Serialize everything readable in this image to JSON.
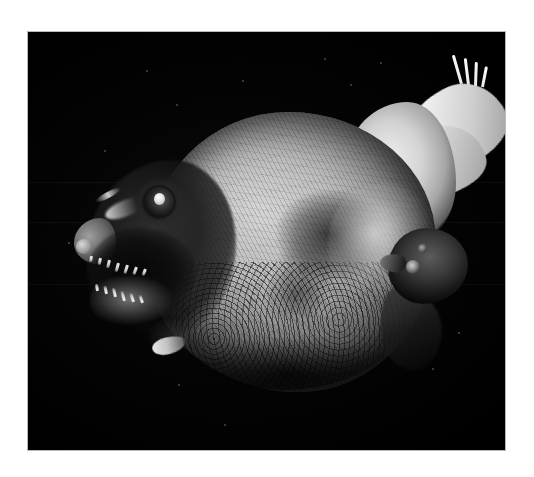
{
  "page": {
    "background_color": "#ffffff",
    "width": 534,
    "height": 477
  },
  "photo": {
    "alt": "Black-and-white photograph of a preserved deep-sea fish specimen on a black background",
    "frame_border_color": "#b9b9b9",
    "background_color": "#000000",
    "left": 27,
    "top": 31,
    "width": 479,
    "height": 420
  },
  "subject": {
    "name": "deep-sea fish specimen",
    "description": "Disc-shaped sunfish-like body with a dark head, large round eye, gaping jaw with sharp teeth, a bright radiating caudal fin at upper right, and a smaller dark attached fish head at the right flank.",
    "parts": [
      {
        "id": "body-disc",
        "label": "body disc"
      },
      {
        "id": "head",
        "label": "head"
      },
      {
        "id": "eye",
        "label": "eye"
      },
      {
        "id": "mouth",
        "label": "mouth with teeth"
      },
      {
        "id": "dorsal-lobe",
        "label": "dorsal lobe"
      },
      {
        "id": "caudal-fin",
        "label": "caudal fin"
      },
      {
        "id": "attached-head",
        "label": "attached fish head"
      },
      {
        "id": "ventral-fin",
        "label": "ventral fin"
      }
    ]
  },
  "tail": {
    "ray_count": 7,
    "spike_count": 4,
    "color_light": "#f2f2f2",
    "color_dark": "#6e6e6e"
  },
  "teeth": {
    "upper_count": 7,
    "lower_count": 6,
    "color": "#f2f2f2"
  },
  "specks": [
    {
      "x": 118,
      "y": 38,
      "r": 1.2
    },
    {
      "x": 214,
      "y": 48,
      "r": 1.0
    },
    {
      "x": 296,
      "y": 26,
      "r": 1.1
    },
    {
      "x": 322,
      "y": 52,
      "r": 0.9
    },
    {
      "x": 148,
      "y": 72,
      "r": 0.9
    },
    {
      "x": 76,
      "y": 118,
      "r": 1.0
    },
    {
      "x": 40,
      "y": 210,
      "r": 0.8
    },
    {
      "x": 196,
      "y": 392,
      "r": 1.0
    },
    {
      "x": 150,
      "y": 352,
      "r": 0.9
    },
    {
      "x": 404,
      "y": 336,
      "r": 0.9
    },
    {
      "x": 430,
      "y": 300,
      "r": 0.8
    },
    {
      "x": 352,
      "y": 30,
      "r": 0.9
    }
  ],
  "caption": ""
}
